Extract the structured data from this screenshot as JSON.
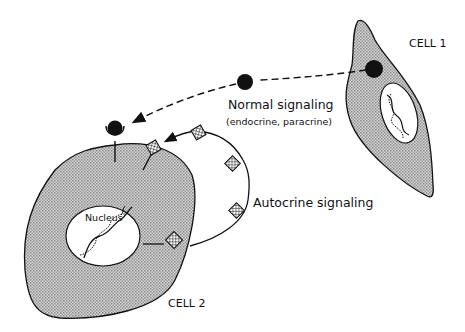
{
  "diagram": {
    "type": "cell-signaling-illustration",
    "labels": {
      "cell1": "CELL 1",
      "cell2": "CELL 2",
      "normal_signaling": "Normal signaling",
      "normal_signaling_sub": "(endocrine, paracrine)",
      "autocrine_signaling": "Autocrine signaling",
      "nucleus": "Nucleus"
    },
    "colors": {
      "cell_fill": "#c8c8c8",
      "outline": "#111111",
      "ligand": "#111111",
      "background": "#ffffff"
    }
  }
}
